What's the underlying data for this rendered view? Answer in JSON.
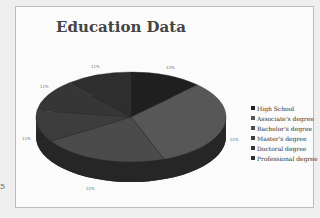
{
  "chart_data": {
    "type": "pie",
    "style": "3d",
    "title": "Education Data",
    "categories": [
      "High School",
      "Associate's degree",
      "Bachelor's degree",
      "Master's degree",
      "Doctoral degree",
      "Professional degree"
    ],
    "values": [
      12,
      31,
      21,
      11,
      11,
      11
    ],
    "value_labels": [
      "12%",
      "31%",
      "21%",
      "11%",
      "11%",
      "11%"
    ],
    "colors": [
      "#1f1f1f",
      "#575757",
      "#4b4b4b",
      "#3d3d3d",
      "#363636",
      "#2e2e2e"
    ],
    "legend_position": "right"
  },
  "legend": {
    "items": [
      {
        "label": "High School",
        "color": "#1f1f1f"
      },
      {
        "label": "Associate's degree",
        "color": "#575757"
      },
      {
        "label": "Bachelor's degree",
        "color": "#4b4b4b"
      },
      {
        "label": "Master's degree",
        "color": "#3d3d3d"
      },
      {
        "label": "Doctoral degree",
        "color": "#363636"
      },
      {
        "label": "Professional degree",
        "color": "#2e2e2e"
      }
    ]
  },
  "edge_mark": "5"
}
